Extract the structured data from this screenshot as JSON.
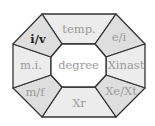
{
  "diagram": {
    "shape": "octagon-wheel",
    "colors": {
      "center_fill": "#ffffff",
      "side_fill": "#ececec",
      "corner_fill": "#dedede",
      "stroke": "#333333",
      "label_muted": "#9a9a9a",
      "label_active": "#222222"
    },
    "center": {
      "label": "degree"
    },
    "cells": [
      {
        "id": "top",
        "label": "temp.",
        "active": false
      },
      {
        "id": "top-right",
        "label": "e/i",
        "active": false
      },
      {
        "id": "right",
        "label": "Xinast",
        "active": false
      },
      {
        "id": "bottom-right",
        "label": "Xe/Xt",
        "active": false
      },
      {
        "id": "bottom",
        "label": "Xr",
        "active": false
      },
      {
        "id": "bottom-left",
        "label": "m/f",
        "active": false
      },
      {
        "id": "left",
        "label": "m.i.",
        "active": false
      },
      {
        "id": "top-left",
        "label": "i/v",
        "active": true
      }
    ]
  }
}
